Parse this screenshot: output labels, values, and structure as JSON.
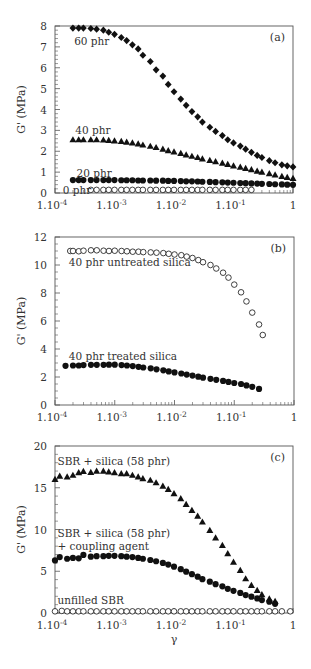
{
  "chart_data": [
    {
      "type": "scatter",
      "panel": "(a)",
      "xscale": "log",
      "xlim": [
        0.0001,
        1
      ],
      "ylim": [
        0,
        8
      ],
      "xticks": [
        "1.10-4",
        "1.10-3",
        "1.10-2",
        "1.10-1",
        "1"
      ],
      "yticks": [
        0,
        1,
        2,
        3,
        4,
        5,
        6,
        7,
        8
      ],
      "ylabel": "G' (MPa)",
      "xlabel": "",
      "grid": false,
      "series": [
        {
          "name": "60 phr",
          "marker": "diamond-filled",
          "x": [
            0.0002,
            0.00025,
            0.0003,
            0.0004,
            0.0005,
            0.00065,
            0.0008,
            0.001,
            0.0013,
            0.0016,
            0.002,
            0.0025,
            0.003,
            0.004,
            0.005,
            0.0065,
            0.008,
            0.01,
            0.013,
            0.016,
            0.02,
            0.025,
            0.03,
            0.04,
            0.05,
            0.065,
            0.08,
            0.1,
            0.13,
            0.16,
            0.2,
            0.25,
            0.3,
            0.4,
            0.5,
            0.65,
            0.8,
            1
          ],
          "values": [
            7.9,
            7.9,
            7.9,
            7.88,
            7.85,
            7.8,
            7.7,
            7.6,
            7.45,
            7.3,
            7.1,
            6.9,
            6.6,
            6.3,
            5.9,
            5.6,
            5.2,
            4.85,
            4.5,
            4.2,
            3.9,
            3.65,
            3.4,
            3.15,
            2.95,
            2.75,
            2.55,
            2.4,
            2.25,
            2.1,
            1.95,
            1.8,
            1.7,
            1.55,
            1.45,
            1.35,
            1.3,
            1.25
          ]
        },
        {
          "name": "40 phr",
          "marker": "triangle-filled",
          "x": [
            0.0002,
            0.00025,
            0.0003,
            0.0004,
            0.0005,
            0.00065,
            0.0008,
            0.001,
            0.0013,
            0.0016,
            0.002,
            0.0025,
            0.003,
            0.004,
            0.005,
            0.0065,
            0.008,
            0.01,
            0.013,
            0.016,
            0.02,
            0.025,
            0.03,
            0.04,
            0.05,
            0.065,
            0.08,
            0.1,
            0.13,
            0.16,
            0.2,
            0.25,
            0.3,
            0.4,
            0.5,
            0.65,
            0.8,
            1
          ],
          "values": [
            2.55,
            2.55,
            2.55,
            2.55,
            2.55,
            2.54,
            2.52,
            2.5,
            2.47,
            2.44,
            2.4,
            2.35,
            2.3,
            2.24,
            2.18,
            2.1,
            2.03,
            1.97,
            1.9,
            1.83,
            1.76,
            1.7,
            1.63,
            1.56,
            1.5,
            1.43,
            1.37,
            1.3,
            1.24,
            1.18,
            1.12,
            1.05,
            1.0,
            0.93,
            0.87,
            0.8,
            0.75,
            0.7
          ]
        },
        {
          "name": "20 phr",
          "marker": "circle-filled",
          "x": [
            0.0002,
            0.00025,
            0.0003,
            0.0004,
            0.0005,
            0.00065,
            0.0008,
            0.001,
            0.0013,
            0.0016,
            0.002,
            0.0025,
            0.003,
            0.004,
            0.005,
            0.0065,
            0.008,
            0.01,
            0.013,
            0.016,
            0.02,
            0.025,
            0.03,
            0.04,
            0.05,
            0.065,
            0.08,
            0.1,
            0.13,
            0.16,
            0.2,
            0.25,
            0.3,
            0.4,
            0.5,
            0.65,
            0.8,
            1
          ],
          "values": [
            0.62,
            0.62,
            0.62,
            0.62,
            0.62,
            0.62,
            0.62,
            0.62,
            0.61,
            0.61,
            0.61,
            0.6,
            0.6,
            0.6,
            0.59,
            0.59,
            0.58,
            0.58,
            0.57,
            0.56,
            0.56,
            0.55,
            0.54,
            0.53,
            0.52,
            0.51,
            0.5,
            0.49,
            0.48,
            0.47,
            0.46,
            0.45,
            0.44,
            0.43,
            0.42,
            0.41,
            0.4,
            0.39
          ]
        },
        {
          "name": "0 phr",
          "marker": "circle-open",
          "x": [
            0.0004,
            0.0005,
            0.00065,
            0.0008,
            0.001,
            0.0013,
            0.0016,
            0.002,
            0.0025,
            0.003,
            0.004,
            0.005,
            0.0065,
            0.008,
            0.01,
            0.013,
            0.016,
            0.02,
            0.025,
            0.03,
            0.04,
            0.05,
            0.065,
            0.08,
            0.1,
            0.13,
            0.16,
            0.2
          ],
          "values": [
            0.15,
            0.15,
            0.15,
            0.15,
            0.15,
            0.15,
            0.15,
            0.15,
            0.15,
            0.15,
            0.15,
            0.15,
            0.15,
            0.15,
            0.15,
            0.15,
            0.15,
            0.15,
            0.15,
            0.15,
            0.15,
            0.15,
            0.15,
            0.15,
            0.15,
            0.15,
            0.15,
            0.15
          ]
        }
      ],
      "annotations": [
        {
          "text": "60 phr",
          "x": 0.00021,
          "y": 7.3
        },
        {
          "text": "40 phr",
          "x": 0.00022,
          "y": 3.0
        },
        {
          "text": "20 phr",
          "x": 0.00023,
          "y": 0.95
        },
        {
          "text": "0 phr",
          "x": 0.000135,
          "y": 0.15
        }
      ]
    },
    {
      "type": "scatter",
      "panel": "(b)",
      "xscale": "log",
      "xlim": [
        0.0001,
        1
      ],
      "ylim": [
        0,
        12
      ],
      "xticks": [
        "1.10-4",
        "1.10-3",
        "1.10-2",
        "1.10-1",
        "1"
      ],
      "yticks": [
        0,
        2,
        4,
        6,
        8,
        10,
        12
      ],
      "ylabel": "G' (MPa)",
      "xlabel": "",
      "grid": false,
      "series": [
        {
          "name": "40 phr untreated silica",
          "marker": "circle-open",
          "x": [
            0.00018,
            0.0002,
            0.00025,
            0.0003,
            0.0004,
            0.0005,
            0.00065,
            0.0008,
            0.001,
            0.0013,
            0.0016,
            0.002,
            0.0025,
            0.003,
            0.004,
            0.005,
            0.0065,
            0.008,
            0.01,
            0.013,
            0.016,
            0.02,
            0.025,
            0.03,
            0.04,
            0.05,
            0.065,
            0.08,
            0.1,
            0.13,
            0.16,
            0.2,
            0.26
          ],
          "values": [
            11.0,
            11.0,
            10.98,
            11.02,
            11.05,
            11.05,
            11.02,
            11.0,
            11.02,
            11.0,
            10.98,
            10.95,
            10.95,
            10.92,
            10.9,
            10.88,
            10.85,
            10.8,
            10.75,
            10.7,
            10.6,
            10.5,
            10.35,
            10.2,
            10.0,
            9.75,
            9.45,
            9.1,
            8.6,
            8.05,
            7.4,
            6.6,
            5.75
          ]
        },
        {
          "name": "40 phr treated silica",
          "marker": "circle-filled",
          "x": [
            0.00015,
            0.0002,
            0.00025,
            0.0003,
            0.0004,
            0.0005,
            0.00065,
            0.0008,
            0.001,
            0.0013,
            0.0016,
            0.002,
            0.0025,
            0.003,
            0.004,
            0.005,
            0.0065,
            0.008,
            0.01,
            0.013,
            0.016,
            0.02,
            0.025,
            0.03,
            0.04,
            0.05,
            0.065,
            0.08,
            0.1,
            0.13,
            0.16,
            0.2,
            0.26
          ],
          "values": [
            2.8,
            2.82,
            2.82,
            2.85,
            2.87,
            2.87,
            2.87,
            2.88,
            2.88,
            2.85,
            2.82,
            2.78,
            2.73,
            2.68,
            2.62,
            2.55,
            2.48,
            2.4,
            2.33,
            2.25,
            2.17,
            2.1,
            2.02,
            1.95,
            1.87,
            1.8,
            1.72,
            1.65,
            1.57,
            1.5,
            1.4,
            1.3,
            1.15
          ]
        }
      ],
      "extra_point": {
        "series": "40 phr untreated silica",
        "x": 0.3,
        "y": 5.0
      },
      "annotations": [
        {
          "text": "40 phr untreated silica",
          "x": 0.00017,
          "y": 10.25
        },
        {
          "text": "40 phr treated silica",
          "x": 0.00017,
          "y": 3.5
        }
      ]
    },
    {
      "type": "scatter",
      "panel": "(c)",
      "xscale": "log",
      "xlim": [
        0.0001,
        1
      ],
      "ylim": [
        0,
        20
      ],
      "xticks": [
        "1.10-4",
        "1.10-3",
        "1.10-2",
        "1.10-1",
        "1"
      ],
      "yticks": [
        0,
        5,
        10,
        15,
        20
      ],
      "ylabel": "G' (MPa)",
      "xlabel": "γ",
      "grid": false,
      "series": [
        {
          "name": "SBR + silica (58 phr)",
          "marker": "triangle-filled",
          "x": [
            0.0001,
            0.00012,
            0.00016,
            0.0002,
            0.00025,
            0.0003,
            0.0004,
            0.0005,
            0.00065,
            0.0008,
            0.001,
            0.0013,
            0.0016,
            0.002,
            0.0025,
            0.003,
            0.004,
            0.005,
            0.0065,
            0.008,
            0.01,
            0.013,
            0.016,
            0.02,
            0.025,
            0.03,
            0.04,
            0.05,
            0.065,
            0.08,
            0.1,
            0.13,
            0.16,
            0.2,
            0.25,
            0.3,
            0.4,
            0.5
          ],
          "values": [
            16.0,
            16.4,
            16.3,
            16.5,
            16.8,
            16.95,
            16.85,
            17.0,
            17.0,
            16.9,
            16.8,
            16.7,
            16.7,
            16.5,
            16.3,
            16.1,
            15.9,
            15.6,
            15.2,
            14.8,
            14.3,
            13.7,
            13.0,
            12.3,
            11.6,
            10.9,
            9.9,
            9.0,
            8.1,
            7.1,
            6.1,
            5.1,
            4.1,
            3.3,
            2.7,
            2.2,
            1.7,
            1.4
          ]
        },
        {
          "name": "SBR + silica (58 phr) + coupling agent",
          "marker": "circle-filled",
          "x": [
            0.0001,
            0.00012,
            0.00016,
            0.0002,
            0.00025,
            0.0003,
            0.0004,
            0.0005,
            0.00065,
            0.0008,
            0.001,
            0.0013,
            0.0016,
            0.002,
            0.0025,
            0.003,
            0.004,
            0.005,
            0.0065,
            0.008,
            0.01,
            0.013,
            0.016,
            0.02,
            0.025,
            0.03,
            0.04,
            0.05,
            0.065,
            0.08,
            0.1,
            0.13,
            0.16,
            0.2,
            0.25,
            0.3,
            0.4,
            0.5
          ],
          "values": [
            6.3,
            6.7,
            6.5,
            6.6,
            6.55,
            6.95,
            6.75,
            6.8,
            6.8,
            6.85,
            6.85,
            6.8,
            6.75,
            6.7,
            6.6,
            6.5,
            6.35,
            6.2,
            6.0,
            5.8,
            5.55,
            5.25,
            4.95,
            4.65,
            4.35,
            4.05,
            3.75,
            3.45,
            3.2,
            2.9,
            2.65,
            2.4,
            2.15,
            1.95,
            1.75,
            1.55,
            1.35,
            1.1
          ]
        },
        {
          "name": "unfilled SBR",
          "marker": "circle-open",
          "x": [
            0.0001,
            0.00013,
            0.00016,
            0.0002,
            0.00025,
            0.0003,
            0.0004,
            0.0005,
            0.00065,
            0.0008,
            0.001,
            0.0013,
            0.0016,
            0.002,
            0.0025,
            0.003,
            0.004,
            0.005,
            0.0065,
            0.008,
            0.01,
            0.013,
            0.016,
            0.02,
            0.025,
            0.03,
            0.04,
            0.05,
            0.065,
            0.08,
            0.1,
            0.13,
            0.16,
            0.2,
            0.25,
            0.3,
            0.4,
            0.5,
            0.65,
            0.9
          ],
          "values": [
            0.2,
            0.25,
            0.2,
            0.2,
            0.2,
            0.2,
            0.2,
            0.2,
            0.2,
            0.2,
            0.2,
            0.2,
            0.2,
            0.2,
            0.2,
            0.2,
            0.2,
            0.2,
            0.2,
            0.2,
            0.2,
            0.2,
            0.2,
            0.2,
            0.2,
            0.2,
            0.2,
            0.2,
            0.2,
            0.2,
            0.2,
            0.2,
            0.2,
            0.2,
            0.2,
            0.2,
            0.2,
            0.2,
            0.2,
            0.2
          ]
        }
      ],
      "annotations": [
        {
          "text": "SBR + silica (58 phr)",
          "x": 0.00011,
          "y": 18.2
        },
        {
          "text": "SBR + silica (58 phr)",
          "x": 0.00011,
          "y": 9.6
        },
        {
          "text": "+ coupling agent",
          "x": 0.00011,
          "y": 8.0
        },
        {
          "text": "unfilled SBR",
          "x": 0.00011,
          "y": 1.6
        }
      ]
    }
  ],
  "panels_layout": [
    {
      "left": 55,
      "right": 293,
      "top": 26,
      "bottom": 193
    },
    {
      "left": 55,
      "right": 294,
      "top": 237,
      "bottom": 405
    },
    {
      "left": 55,
      "right": 293,
      "top": 446,
      "bottom": 613
    }
  ],
  "colors": {
    "frame": "#555555",
    "marker": "#111111",
    "text": "#333333",
    "background": "#ffffff"
  }
}
